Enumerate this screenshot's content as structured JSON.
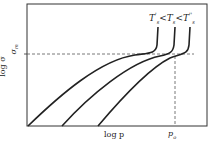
{
  "diagram": {
    "title": "",
    "legend_label": "T'_s < T_s < T''_s",
    "legend_parts": [
      "T",
      "'",
      "s",
      "<",
      "T",
      "s",
      "<",
      "T",
      "''",
      "s"
    ],
    "xlabel": "log p",
    "ylabel": "log σ",
    "ylabel_extra": "σ_m",
    "y_marker_label": "σ",
    "y_marker_sub": "m",
    "x_marker_label": "p",
    "x_marker_sub": "o",
    "curves": [
      {
        "name": "T'_s",
        "start_x": 28,
        "vertical_x": 158
      },
      {
        "name": "T_s",
        "start_x": 62,
        "vertical_x": 174
      },
      {
        "name": "T''_s",
        "start_x": 98,
        "vertical_x": 190
      }
    ],
    "colors": {
      "curve": "#222222",
      "dashed": "#555555",
      "frame": "#333333"
    }
  }
}
